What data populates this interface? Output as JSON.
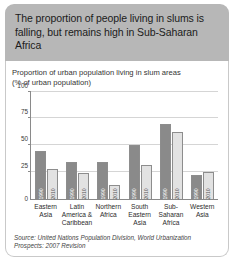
{
  "header": {
    "title": "The proportion of people living in slums is falling, but remains high in Sub-Saharan Africa",
    "background_color": "#b7b7b7"
  },
  "chart_data": {
    "type": "bar",
    "title": "Proportion of urban population living in slum areas",
    "subtitle": "(% of urban population)",
    "xlabel": "",
    "ylabel": "",
    "ylim": [
      0,
      100
    ],
    "yticks": [
      100,
      75,
      50,
      25,
      0
    ],
    "ytick_labels": [
      "100",
      "75",
      "50",
      "25",
      "0"
    ],
    "grid": true,
    "legend_position": "in-bar",
    "categories": [
      "Eastern Asia",
      "Latin America & Caribbean",
      "Northern Africa",
      "South Eastern Asia",
      "Sub-Saharan Africa",
      "Western Asia"
    ],
    "category_lines": [
      [
        "Eastern",
        "Asia"
      ],
      [
        "Latin",
        "America &",
        "Caribbean"
      ],
      [
        "Northern",
        "Africa"
      ],
      [
        "South",
        "Eastern",
        "Asia"
      ],
      [
        "Sub-",
        "Saharan",
        "Africa"
      ],
      [
        "Western",
        "Asia"
      ]
    ],
    "series": [
      {
        "name": "1990",
        "color": "#8a8a8a",
        "values": [
          44,
          34,
          34,
          50,
          70,
          22
        ]
      },
      {
        "name": "2010",
        "color": "#e2e2e2",
        "values": [
          28,
          24,
          13,
          31,
          62,
          25
        ]
      }
    ],
    "bar_labels": {
      "series_1": "1990",
      "series_2": "2010"
    },
    "source": "Source: United Nations Population Division, World Urbanization Prospects: 2007 Revision"
  },
  "source": {
    "line1": "Source: United Nations Population Division, World Urbanization",
    "line2": "Prospects: 2007 Revision"
  }
}
